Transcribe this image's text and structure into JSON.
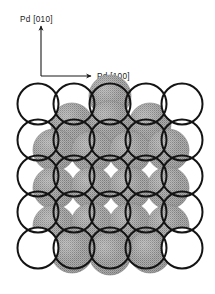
{
  "figure": {
    "type": "crystal-surface-structure-diagram",
    "background_color": "#ffffff"
  },
  "axes": {
    "vertical": {
      "label": "Pd [010]",
      "direction": "up",
      "arrow_icon": "arrow-up-icon",
      "tail": {
        "x": 41,
        "y": 76
      },
      "head": {
        "x": 41,
        "y": 26
      }
    },
    "horizontal": {
      "label": "Pd [100]",
      "direction": "right",
      "arrow_icon": "arrow-right-icon",
      "tail": {
        "x": 41,
        "y": 76
      },
      "head": {
        "x": 91,
        "y": 76
      }
    },
    "line_color": "#1a1a1a",
    "line_width": 1.1
  },
  "lattice": {
    "name": "Pd substrate atoms",
    "style": "open-circle",
    "outline_color": "#141414",
    "fill_color": "#ffffff",
    "outline_width": 2.0,
    "radius": 20.5,
    "spacing_x": 36.0,
    "spacing_y": 36.0,
    "origin": {
      "x": 38.0,
      "y": 104.0
    },
    "columns": 5,
    "rows": 5,
    "centers": [
      {
        "x": 38,
        "y": 104
      },
      {
        "x": 74,
        "y": 104
      },
      {
        "x": 110,
        "y": 104
      },
      {
        "x": 146,
        "y": 104
      },
      {
        "x": 182,
        "y": 104
      },
      {
        "x": 38,
        "y": 140
      },
      {
        "x": 74,
        "y": 140
      },
      {
        "x": 110,
        "y": 140
      },
      {
        "x": 146,
        "y": 140
      },
      {
        "x": 182,
        "y": 140
      },
      {
        "x": 38,
        "y": 176
      },
      {
        "x": 74,
        "y": 176
      },
      {
        "x": 110,
        "y": 176
      },
      {
        "x": 146,
        "y": 176
      },
      {
        "x": 182,
        "y": 176
      },
      {
        "x": 38,
        "y": 212
      },
      {
        "x": 74,
        "y": 212
      },
      {
        "x": 110,
        "y": 212
      },
      {
        "x": 146,
        "y": 212
      },
      {
        "x": 182,
        "y": 212
      },
      {
        "x": 38,
        "y": 248
      },
      {
        "x": 74,
        "y": 248
      },
      {
        "x": 110,
        "y": 248
      },
      {
        "x": 146,
        "y": 248
      },
      {
        "x": 182,
        "y": 248
      }
    ]
  },
  "overlayer": {
    "name": "Adsorbate overlayer atoms",
    "style": "filled-stippled-circle",
    "fill_color": "#9e9e9e",
    "stipple_color": "#6f6f6f",
    "edge_color": "#8a8a8a",
    "radius": 21.0,
    "centers": [
      {
        "x": 110,
        "y": 96
      },
      {
        "x": 72,
        "y": 124
      },
      {
        "x": 110,
        "y": 122
      },
      {
        "x": 150,
        "y": 124
      },
      {
        "x": 54,
        "y": 150
      },
      {
        "x": 92,
        "y": 152
      },
      {
        "x": 130,
        "y": 152
      },
      {
        "x": 168,
        "y": 150
      },
      {
        "x": 54,
        "y": 188
      },
      {
        "x": 92,
        "y": 188
      },
      {
        "x": 130,
        "y": 188
      },
      {
        "x": 168,
        "y": 188
      },
      {
        "x": 54,
        "y": 226
      },
      {
        "x": 92,
        "y": 224
      },
      {
        "x": 130,
        "y": 224
      },
      {
        "x": 168,
        "y": 226
      },
      {
        "x": 72,
        "y": 252
      },
      {
        "x": 110,
        "y": 254
      },
      {
        "x": 150,
        "y": 252
      }
    ]
  }
}
